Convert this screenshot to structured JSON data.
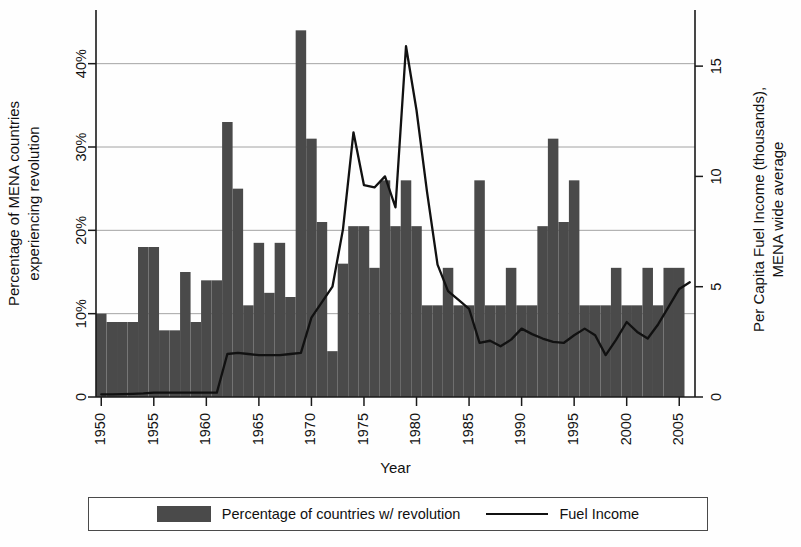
{
  "chart_data": {
    "type": "bar",
    "title": "",
    "xlabel": "Year",
    "ylabel": "Percentage of MENA countries experiencing revolution",
    "y2label": "Per Capita Fuel Income (thousands), MENA wide average",
    "grid": true,
    "legend_position": "bottom",
    "xlim": [
      1949.5,
      2006.5
    ],
    "ylim": [
      0,
      45
    ],
    "y2lim": [
      0,
      17
    ],
    "x_tick_labels": [
      "1950",
      "1955",
      "1960",
      "1965",
      "1970",
      "1975",
      "1980",
      "1985",
      "1990",
      "1995",
      "2000",
      "2005"
    ],
    "x_tick_values": [
      1950,
      1955,
      1960,
      1965,
      1970,
      1975,
      1980,
      1985,
      1990,
      1995,
      2000,
      2005
    ],
    "y_tick_labels": [
      "0",
      "10%",
      "20%",
      "30%",
      "40%"
    ],
    "y_tick_values": [
      0,
      10,
      20,
      30,
      40
    ],
    "y2_tick_labels": [
      "0",
      "5",
      "10",
      "15"
    ],
    "y2_tick_values": [
      0,
      5,
      10,
      15
    ],
    "series": [
      {
        "name": "Percentage of countries w/ revolution",
        "kind": "bar",
        "axis": "left",
        "color": "#4a4a4a",
        "x": [
          1950,
          1951,
          1952,
          1953,
          1954,
          1955,
          1956,
          1957,
          1958,
          1959,
          1960,
          1961,
          1962,
          1963,
          1964,
          1965,
          1966,
          1967,
          1968,
          1969,
          1970,
          1971,
          1972,
          1973,
          1974,
          1975,
          1976,
          1977,
          1978,
          1979,
          1980,
          1981,
          1982,
          1983,
          1984,
          1985,
          1986,
          1987,
          1988,
          1989,
          1990,
          1991,
          1992,
          1993,
          1994,
          1995,
          1996,
          1997,
          1998,
          1999,
          2000,
          2001,
          2002,
          2003,
          2004,
          2005,
          2006
        ],
        "values": [
          10,
          9,
          9,
          9,
          18,
          18,
          8,
          8,
          15,
          9,
          14,
          14,
          33,
          25,
          11,
          18.5,
          12.5,
          18.5,
          12,
          44,
          31,
          21,
          5.5,
          16,
          20.5,
          20.5,
          15.5,
          26,
          20.5,
          26,
          20.5,
          11,
          11,
          15.5,
          11,
          11,
          26,
          11,
          11,
          15.5,
          11,
          11,
          20.5,
          31,
          21,
          26,
          11,
          11,
          11,
          15.5,
          11,
          11,
          15.5,
          11,
          15.5,
          15.5,
          0
        ]
      },
      {
        "name": "Fuel Income",
        "kind": "line",
        "axis": "right",
        "color": "#111111",
        "x": [
          1950,
          1951,
          1952,
          1953,
          1954,
          1955,
          1956,
          1957,
          1958,
          1959,
          1960,
          1961,
          1962,
          1963,
          1964,
          1965,
          1966,
          1967,
          1968,
          1969,
          1970,
          1971,
          1972,
          1973,
          1974,
          1975,
          1976,
          1977,
          1978,
          1979,
          1980,
          1981,
          1982,
          1983,
          1984,
          1985,
          1986,
          1987,
          1988,
          1989,
          1990,
          1991,
          1992,
          1993,
          1994,
          1995,
          1996,
          1997,
          1998,
          1999,
          2000,
          2001,
          2002,
          2003,
          2004,
          2005,
          2006
        ],
        "values": [
          0.12,
          0.12,
          0.13,
          0.14,
          0.16,
          0.2,
          0.2,
          0.2,
          0.2,
          0.2,
          0.2,
          0.2,
          1.95,
          2.0,
          1.95,
          1.9,
          1.9,
          1.9,
          1.95,
          2.0,
          3.6,
          4.3,
          5.0,
          7.6,
          12.0,
          9.6,
          9.5,
          10.0,
          8.6,
          15.9,
          13.0,
          9.3,
          6.0,
          4.8,
          4.4,
          4.0,
          2.45,
          2.55,
          2.3,
          2.6,
          3.1,
          2.85,
          2.65,
          2.5,
          2.45,
          2.8,
          3.1,
          2.8,
          1.9,
          2.6,
          3.4,
          2.95,
          2.65,
          3.3,
          4.1,
          4.9,
          5.2
        ]
      }
    ]
  },
  "legend": {
    "bar_label": "Percentage of countries w/ revolution",
    "line_label": "Fuel Income"
  },
  "icons": {
    "bar_swatch": "filled-rectangle-swatch",
    "line_swatch": "horizontal-line-swatch"
  }
}
